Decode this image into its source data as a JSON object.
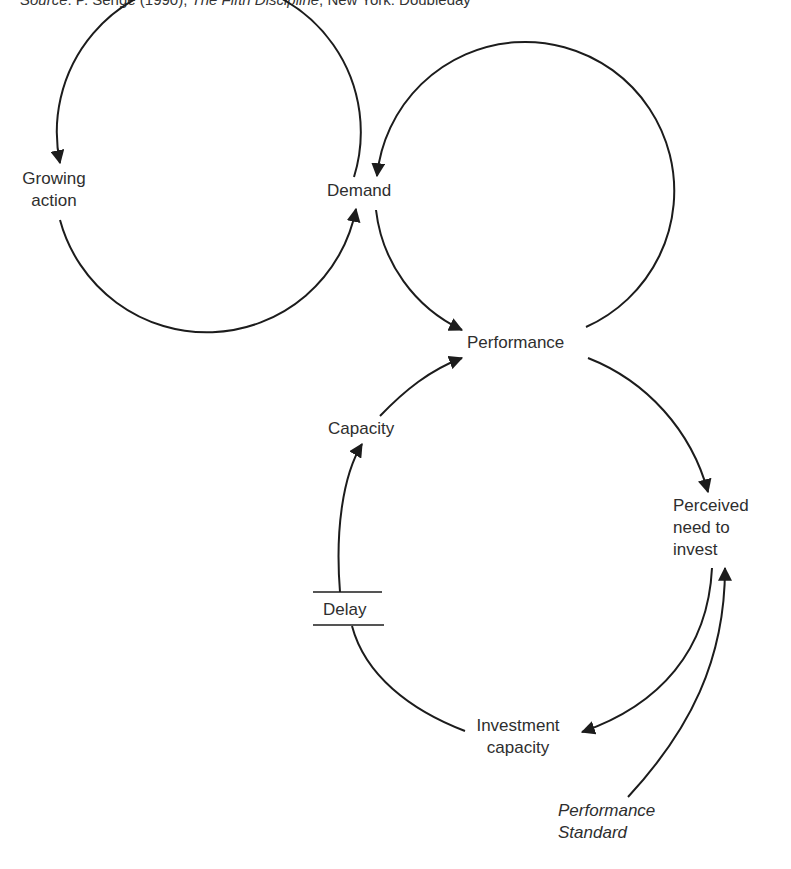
{
  "caption": {
    "source_label": "Source",
    "source_rest": ": P. Senge (1990), ",
    "book_title": "The Fifth Discipline",
    "publisher": ", New York: Doubleday"
  },
  "nodes": {
    "growing_action": {
      "line1": "Growing",
      "line2": "action"
    },
    "demand": {
      "label": "Demand"
    },
    "performance": {
      "label": "Performance"
    },
    "capacity": {
      "label": "Capacity"
    },
    "delay": {
      "label": "Delay"
    },
    "perceived_need": {
      "line1": "Perceived",
      "line2": "need to",
      "line3": "invest"
    },
    "investment_capacity": {
      "line1": "Investment",
      "line2": "capacity"
    },
    "performance_standard": {
      "line1": "Performance",
      "line2": "Standard"
    }
  },
  "links": [
    {
      "from": "Demand",
      "to": "Growing action"
    },
    {
      "from": "Growing action",
      "to": "Demand"
    },
    {
      "from": "Performance",
      "to": "Demand"
    },
    {
      "from": "Demand",
      "to": "Performance"
    },
    {
      "from": "Performance",
      "to": "Perceived need to invest"
    },
    {
      "from": "Perceived need to invest",
      "to": "Investment capacity"
    },
    {
      "from": "Investment capacity",
      "to": "Capacity",
      "via": "Delay"
    },
    {
      "from": "Capacity",
      "to": "Performance"
    },
    {
      "from": "Performance Standard",
      "to": "Perceived need to invest"
    }
  ],
  "colors": {
    "line": "#1c1c1c",
    "text": "#2e2e2e",
    "background": "#ffffff"
  }
}
